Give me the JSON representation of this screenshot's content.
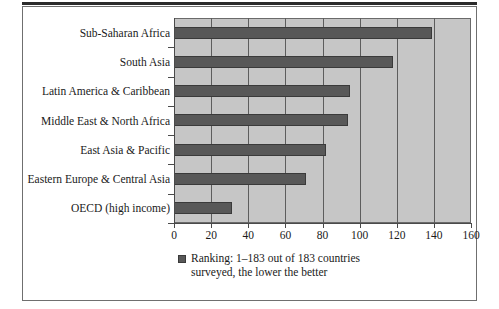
{
  "chart_data": {
    "type": "bar",
    "orientation": "horizontal",
    "title": "",
    "xlabel": "",
    "ylabel": "",
    "xlim": [
      0,
      160
    ],
    "xticks": [
      0,
      20,
      40,
      60,
      80,
      100,
      120,
      140,
      160
    ],
    "grid": true,
    "legend_position": "bottom",
    "categories": [
      "Sub-Saharan Africa",
      "South Asia",
      "Latin America & Caribbean",
      "Middle East & North Africa",
      "East Asia & Pacific",
      "Eastern Europe & Central Asia",
      "OECD (high income)"
    ],
    "values": [
      139,
      118,
      95,
      94,
      82,
      71,
      31
    ],
    "series": [
      {
        "name": "Ranking: 1–183 out of 183 countries surveyed, the lower the better",
        "values": [
          139,
          118,
          95,
          94,
          82,
          71,
          31
        ],
        "color": "#585858"
      }
    ]
  },
  "legend": {
    "marker": "square-swatch",
    "text": "Ranking: 1–183 out of 183 countries surveyed, the lower the better"
  },
  "colors": {
    "bar_fill": "#585858",
    "bar_edge": "#3a3a3a",
    "plot_background": "#c6c6c6",
    "grid": "#5d5d5d",
    "axis": "#4a4a4a",
    "frame": "#6f6f6f",
    "text": "#1a1a1a",
    "page_background": "#ffffff"
  }
}
